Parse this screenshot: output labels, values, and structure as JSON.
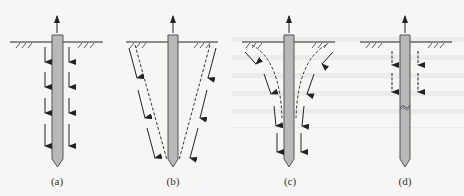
{
  "figure": {
    "colors": {
      "background": "#f6f6f4",
      "pile_fill": "#b8b8b8",
      "pile_stroke": "#555555",
      "line": "#222222"
    },
    "panels": [
      {
        "id": "a",
        "label": "(a)",
        "cx": 57
      },
      {
        "id": "b",
        "label": "(b)",
        "cx": 173
      },
      {
        "id": "c",
        "label": "(c)",
        "cx": 290
      },
      {
        "id": "d",
        "label": "(d)",
        "cx": 405
      }
    ]
  }
}
